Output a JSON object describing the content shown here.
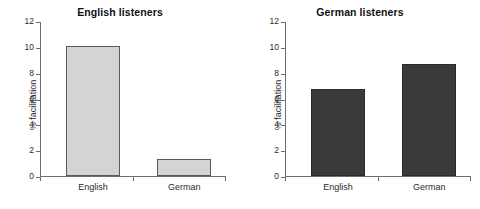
{
  "figure": {
    "background": "#ffffff",
    "panel_count": 2
  },
  "chart_data": [
    {
      "type": "bar",
      "title": "English listeners",
      "categories": [
        "English",
        "German"
      ],
      "values": [
        10.1,
        1.35
      ],
      "xlabel": "",
      "ylabel": "% facilitation",
      "ylim": [
        0,
        12
      ],
      "yticks": [
        0,
        2,
        4,
        6,
        8,
        10,
        12
      ],
      "ytick_labels": [
        "0",
        "2",
        "4",
        "6",
        "8",
        "10",
        "12"
      ],
      "grid": false,
      "legend": false,
      "bar_fill": "#d4d4d4",
      "bar_edge": "#5a5a5a"
    },
    {
      "type": "bar",
      "title": "German listeners",
      "categories": [
        "English",
        "German"
      ],
      "values": [
        6.75,
        8.7
      ],
      "xlabel": "",
      "ylabel": "% facilitation",
      "ylim": [
        0,
        12
      ],
      "yticks": [
        0,
        2,
        4,
        6,
        8,
        10,
        12
      ],
      "ytick_labels": [
        "0",
        "2",
        "4",
        "6",
        "8",
        "10",
        "12"
      ],
      "grid": false,
      "legend": false,
      "bar_fill": "#3a3a3a",
      "bar_edge": "#2a2a2a"
    }
  ]
}
